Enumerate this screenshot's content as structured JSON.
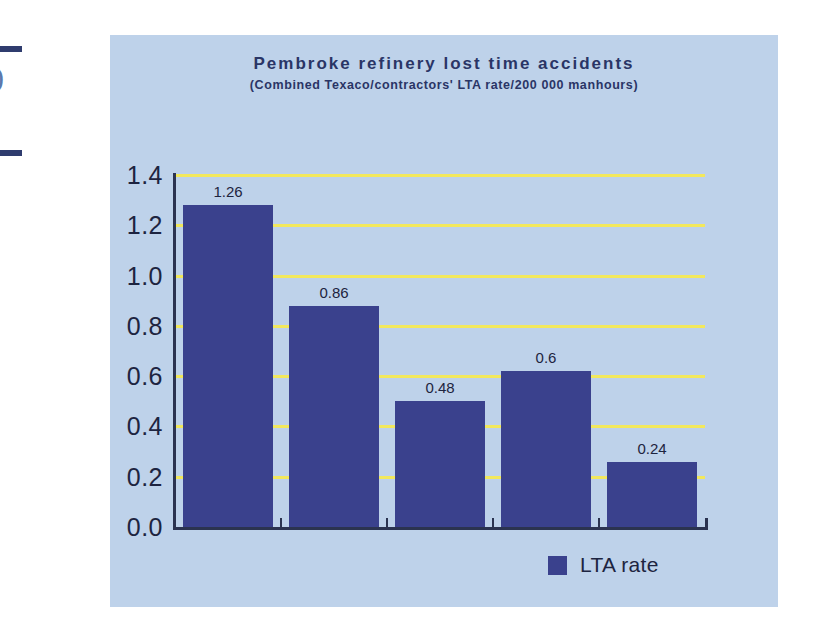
{
  "chart_data": {
    "type": "bar",
    "title": "Pembroke refinery lost time accidents",
    "subtitle": "(Combined Texaco/contractors' LTA rate/200 000 manhours)",
    "xlabel": "",
    "ylabel": "",
    "categories": [
      "",
      "",
      "",
      "",
      ""
    ],
    "values": [
      1.26,
      0.86,
      0.48,
      0.6,
      0.24
    ],
    "value_labels": [
      "1.26",
      "0.86",
      "0.48",
      "0.6",
      "0.24"
    ],
    "series": [
      {
        "name": "LTA rate",
        "values": [
          1.26,
          0.86,
          0.48,
          0.6,
          0.24
        ]
      }
    ],
    "ylim": [
      0.0,
      1.4
    ],
    "ytick_values": [
      0.0,
      0.2,
      0.4,
      0.6,
      0.8,
      1.0,
      1.2,
      1.4
    ],
    "ytick_labels": [
      "0.0",
      "0.2",
      "0.4",
      "0.6",
      "0.8",
      "1.0",
      "1.2",
      "1.4"
    ],
    "grid": true,
    "grid_color": "#f2e85c",
    "legend_position": "bottom-right",
    "legend": [
      "LTA rate"
    ],
    "bar_color": "#3a418d",
    "plot_background": "#bed2ea",
    "axis_color": "#2b3350",
    "text_color": "#1d2440",
    "title_color": "#2a3566"
  },
  "legend": {
    "label": "LTA rate"
  },
  "edge_artifacts": {
    "glyph": ")"
  }
}
